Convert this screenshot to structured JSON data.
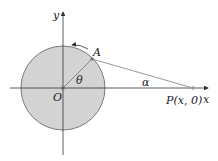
{
  "diagram": {
    "labels": {
      "y_axis": "y",
      "x_axis": "x",
      "origin": "O",
      "point_a": "A",
      "angle_theta": "θ",
      "angle_alpha": "α",
      "point_p": "P(x, 0)"
    },
    "colors": {
      "circle_fill": "#d3d3d3",
      "circle_stroke": "#7a7a7a",
      "axis": "#333333",
      "rod": "#999999"
    }
  }
}
